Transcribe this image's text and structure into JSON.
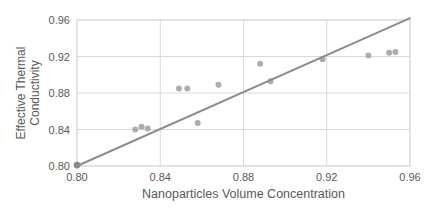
{
  "chart_data": {
    "type": "scatter",
    "title": "",
    "xlabel": "Nanoparticles Volume Concentration",
    "ylabel_lines": [
      "Effective Thermal",
      "Conductivity"
    ],
    "xlim": [
      0.8,
      0.96
    ],
    "ylim": [
      0.8,
      0.96
    ],
    "xtick_labels": [
      "0.80",
      "0.84",
      "0.88",
      "0.92",
      "0.96"
    ],
    "ytick_labels": [
      "0.80",
      "0.84",
      "0.88",
      "0.92",
      "0.96"
    ],
    "grid": true,
    "legend": "none",
    "colors": {
      "background": "#ffffff",
      "gridline": "#d9d9d9",
      "tick_text": "#595959",
      "axis_title_text": "#595959",
      "points": "#a6a6a6",
      "origin_point": "#7f7f7f",
      "trend_line": "#8c8c8c"
    },
    "series": [
      {
        "name": "measured-points",
        "type": "scatter",
        "color": "#a6a6a6",
        "points": [
          [
            0.828,
            0.84
          ],
          [
            0.831,
            0.843
          ],
          [
            0.834,
            0.841
          ],
          [
            0.849,
            0.885
          ],
          [
            0.853,
            0.885
          ],
          [
            0.858,
            0.847
          ],
          [
            0.868,
            0.889
          ],
          [
            0.888,
            0.912
          ],
          [
            0.893,
            0.893
          ],
          [
            0.918,
            0.917
          ],
          [
            0.94,
            0.921
          ],
          [
            0.95,
            0.924
          ],
          [
            0.953,
            0.925
          ]
        ]
      },
      {
        "name": "origin-point",
        "type": "scatter",
        "color": "#7f7f7f",
        "points": [
          [
            0.8,
            0.801
          ]
        ]
      },
      {
        "name": "trend-line",
        "type": "line",
        "color": "#8c8c8c",
        "points": [
          [
            0.8,
            0.8
          ],
          [
            0.96,
            0.962
          ]
        ]
      }
    ]
  }
}
